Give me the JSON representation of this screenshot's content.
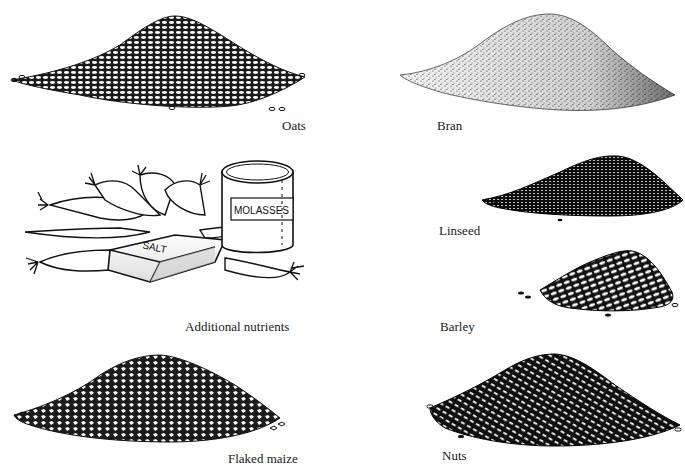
{
  "figure": {
    "background": "#ffffff",
    "ink": "#111111",
    "panels": [
      {
        "id": "oats",
        "label": "Oats",
        "label_pos": [
          282,
          119
        ]
      },
      {
        "id": "bran",
        "label": "Bran",
        "label_pos": [
          437,
          119
        ]
      },
      {
        "id": "additional-nutrients",
        "label": "Additional nutrients",
        "label_pos": [
          185,
          320
        ]
      },
      {
        "id": "linseed",
        "label": "Linseed",
        "label_pos": [
          439,
          224
        ]
      },
      {
        "id": "barley",
        "label": "Barley",
        "label_pos": [
          440,
          320
        ]
      },
      {
        "id": "flaked-maize",
        "label": "Flaked maize",
        "label_pos": [
          228,
          452
        ]
      },
      {
        "id": "nuts",
        "label": "Nuts",
        "label_pos": [
          442,
          449
        ]
      }
    ],
    "objects": {
      "molasses_can_text": "MOLASSES",
      "salt_block_text": "SALT"
    }
  }
}
